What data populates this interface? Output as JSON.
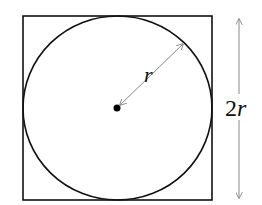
{
  "diagram": {
    "square": {
      "x": 23,
      "y": 16,
      "size": 189,
      "stroke": "#111111"
    },
    "circle": {
      "cx": 117.5,
      "cy": 108,
      "r": 94,
      "stroke": "#111111"
    },
    "center_dot": {
      "cx": 117,
      "cy": 108,
      "r": 3.5
    },
    "radius_arrow": {
      "x1": 120,
      "y1": 106,
      "x2": 183,
      "y2": 44,
      "color": "#888888"
    },
    "radius_label": {
      "text_italic": "r",
      "x": 146,
      "y": 80
    },
    "side_arrow": {
      "x": 239,
      "y1": 18,
      "y2": 199,
      "color": "#888888"
    },
    "side_label": {
      "prefix": "2",
      "italic": "r",
      "x": 226,
      "y": 116
    }
  }
}
